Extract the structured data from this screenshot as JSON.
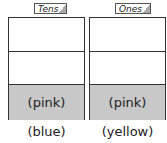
{
  "columns": [
    {
      "header": "Tens",
      "bottom_cell_label": "(pink)",
      "caption": "(blue)"
    },
    {
      "header": "Ones",
      "bottom_cell_label": "(pink)",
      "caption": "(yellow)"
    }
  ],
  "colors": {
    "border": "#333333",
    "shaded_cell": "#c8c8c8",
    "background": "#ffffff"
  }
}
